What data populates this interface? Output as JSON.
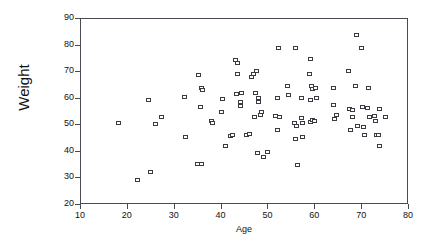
{
  "chart_data": {
    "type": "scatter",
    "title": "",
    "xlabel": "Age",
    "ylabel": "Weight",
    "xlim": [
      10,
      80
    ],
    "ylim": [
      20,
      90
    ],
    "xticks": [
      10,
      20,
      30,
      40,
      50,
      60,
      70,
      80
    ],
    "yticks": [
      20,
      30,
      40,
      50,
      60,
      70,
      80,
      90
    ],
    "grid": false,
    "legend": null,
    "marker": "open-square",
    "marker_color": "#3a3a42",
    "points": [
      {
        "x": 18.0,
        "y": 51.0
      },
      {
        "x": 22.0,
        "y": 29.4
      },
      {
        "x": 24.4,
        "y": 59.6
      },
      {
        "x": 24.8,
        "y": 32.3
      },
      {
        "x": 26.0,
        "y": 50.5
      },
      {
        "x": 27.2,
        "y": 53.0
      },
      {
        "x": 32.0,
        "y": 60.6
      },
      {
        "x": 32.2,
        "y": 45.5
      },
      {
        "x": 35.0,
        "y": 68.9
      },
      {
        "x": 34.9,
        "y": 35.3
      },
      {
        "x": 35.7,
        "y": 35.4
      },
      {
        "x": 35.8,
        "y": 63.9
      },
      {
        "x": 36.0,
        "y": 63.2
      },
      {
        "x": 35.6,
        "y": 56.7
      },
      {
        "x": 37.9,
        "y": 51.5
      },
      {
        "x": 38.0,
        "y": 50.9
      },
      {
        "x": 40.3,
        "y": 60.0
      },
      {
        "x": 40.0,
        "y": 54.9
      },
      {
        "x": 40.8,
        "y": 42.1
      },
      {
        "x": 42.0,
        "y": 45.9
      },
      {
        "x": 42.3,
        "y": 46.3
      },
      {
        "x": 43.0,
        "y": 74.5
      },
      {
        "x": 43.4,
        "y": 73.4
      },
      {
        "x": 43.5,
        "y": 69.4
      },
      {
        "x": 43.2,
        "y": 61.8
      },
      {
        "x": 44.2,
        "y": 62.0
      },
      {
        "x": 44.0,
        "y": 58.8
      },
      {
        "x": 44.1,
        "y": 57.4
      },
      {
        "x": 45.4,
        "y": 46.5
      },
      {
        "x": 45.9,
        "y": 46.8
      },
      {
        "x": 46.3,
        "y": 68.3
      },
      {
        "x": 46.8,
        "y": 69.2
      },
      {
        "x": 47.5,
        "y": 70.3
      },
      {
        "x": 47.0,
        "y": 53.1
      },
      {
        "x": 47.3,
        "y": 62.0
      },
      {
        "x": 47.8,
        "y": 60.2
      },
      {
        "x": 47.9,
        "y": 58.6
      },
      {
        "x": 47.6,
        "y": 39.6
      },
      {
        "x": 48.6,
        "y": 55.0
      },
      {
        "x": 48.4,
        "y": 53.9
      },
      {
        "x": 49.0,
        "y": 38.2
      },
      {
        "x": 49.9,
        "y": 39.9
      },
      {
        "x": 51.6,
        "y": 53.6
      },
      {
        "x": 52.3,
        "y": 53.2
      },
      {
        "x": 52.0,
        "y": 60.3
      },
      {
        "x": 52.1,
        "y": 79.0
      },
      {
        "x": 51.9,
        "y": 48.3
      },
      {
        "x": 54.0,
        "y": 64.7
      },
      {
        "x": 54.3,
        "y": 61.5
      },
      {
        "x": 55.8,
        "y": 79.0
      },
      {
        "x": 55.6,
        "y": 51.0
      },
      {
        "x": 55.9,
        "y": 49.8
      },
      {
        "x": 55.7,
        "y": 44.9
      },
      {
        "x": 56.2,
        "y": 35.2
      },
      {
        "x": 57.0,
        "y": 52.6
      },
      {
        "x": 57.2,
        "y": 51.0
      },
      {
        "x": 57.1,
        "y": 60.4
      },
      {
        "x": 57.3,
        "y": 45.7
      },
      {
        "x": 58.9,
        "y": 74.9
      },
      {
        "x": 58.8,
        "y": 69.4
      },
      {
        "x": 59.1,
        "y": 64.6
      },
      {
        "x": 59.3,
        "y": 63.8
      },
      {
        "x": 59.0,
        "y": 59.7
      },
      {
        "x": 58.9,
        "y": 51.4
      },
      {
        "x": 59.5,
        "y": 52.0
      },
      {
        "x": 59.8,
        "y": 51.8
      },
      {
        "x": 60.1,
        "y": 64.0
      },
      {
        "x": 60.2,
        "y": 60.3
      },
      {
        "x": 63.9,
        "y": 64.0
      },
      {
        "x": 63.8,
        "y": 57.6
      },
      {
        "x": 64.0,
        "y": 52.4
      },
      {
        "x": 64.6,
        "y": 53.9
      },
      {
        "x": 67.1,
        "y": 70.4
      },
      {
        "x": 67.3,
        "y": 56.0
      },
      {
        "x": 68.0,
        "y": 55.9
      },
      {
        "x": 67.6,
        "y": 48.2
      },
      {
        "x": 67.9,
        "y": 53.2
      },
      {
        "x": 68.9,
        "y": 84.0
      },
      {
        "x": 68.6,
        "y": 64.7
      },
      {
        "x": 69.0,
        "y": 49.6
      },
      {
        "x": 69.9,
        "y": 79.0
      },
      {
        "x": 70.1,
        "y": 56.8
      },
      {
        "x": 70.3,
        "y": 49.4
      },
      {
        "x": 70.6,
        "y": 46.4
      },
      {
        "x": 71.4,
        "y": 64.0
      },
      {
        "x": 71.2,
        "y": 56.4
      },
      {
        "x": 71.5,
        "y": 53.2
      },
      {
        "x": 72.6,
        "y": 53.4
      },
      {
        "x": 72.9,
        "y": 51.5
      },
      {
        "x": 73.0,
        "y": 46.2
      },
      {
        "x": 73.4,
        "y": 46.5
      },
      {
        "x": 73.6,
        "y": 56.0
      },
      {
        "x": 73.8,
        "y": 42.1
      },
      {
        "x": 75.0,
        "y": 53.3
      }
    ]
  }
}
